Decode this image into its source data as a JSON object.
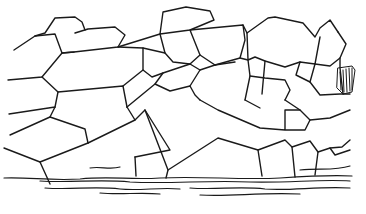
{
  "image": {
    "subject": "Line engraving of a polygonal (Cyclopean) stone masonry wall",
    "ink_color": "#1a1a1a",
    "background": "#ffffff"
  }
}
